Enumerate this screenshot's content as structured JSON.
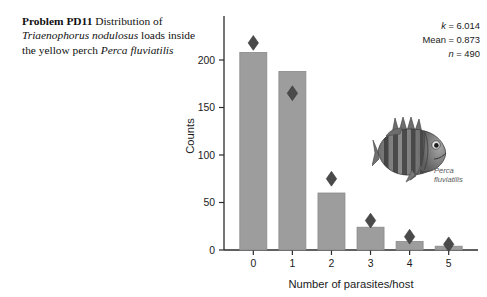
{
  "caption": {
    "problem_label": "Problem PD11",
    "text_1": "Distribution of ",
    "species_1": "Triaenophorus nodulosus",
    "text_2": " loads inside the yellow perch ",
    "species_2": "Perca fluviatilis"
  },
  "stats": {
    "k_label": "k",
    "k_value": " = 6.014",
    "mean_label": "Mean = 0.873",
    "n_label": "n",
    "n_value": " = 490"
  },
  "fish": {
    "genus": "Perca",
    "species": "fluviatilis",
    "alt": "grayscale photograph of a yellow perch"
  },
  "colors": {
    "bar_fill": "#9d9d9d",
    "bar_stroke": "#8a8a8a",
    "marker": "#4a4a4a",
    "axis": "#2b2b2b",
    "text": "#1a1a1a",
    "background": "#ffffff"
  },
  "chart_data": {
    "type": "bar",
    "title": "",
    "xlabel": "Number of parasites/host",
    "ylabel": "Counts",
    "categories": [
      "0",
      "1",
      "2",
      "3",
      "4",
      "5"
    ],
    "values": [
      208,
      188,
      60,
      24,
      9,
      4
    ],
    "series": [
      {
        "name": "Observed counts",
        "type": "bar",
        "values": [
          208,
          188,
          60,
          24,
          9,
          4
        ]
      },
      {
        "name": "Fitted (negative binomial) expected counts",
        "type": "marker",
        "marker": "diamond",
        "values": [
          218,
          165,
          75,
          31,
          14,
          6
        ]
      }
    ],
    "xlim": [
      -0.75,
      5.75
    ],
    "ylim": [
      0,
      240
    ],
    "yticks": [
      0,
      50,
      100,
      150,
      200
    ],
    "ytick_labels": [
      "0",
      "50",
      "100",
      "150",
      "200"
    ],
    "xtick_labels": [
      "0",
      "1",
      "2",
      "3",
      "4",
      "5"
    ],
    "grid": false,
    "legend": "none",
    "annotations": [
      "k = 6.014",
      "Mean = 0.873",
      "n = 490"
    ]
  }
}
